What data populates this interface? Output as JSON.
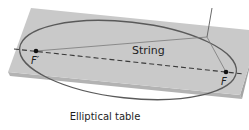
{
  "figure": {
    "caption": "Elliptical table",
    "labels": {
      "string": "String",
      "focus_left": "F′",
      "focus_right": "F"
    },
    "colors": {
      "table_top": "#c9c9c9",
      "table_edge": "#b3b3b3",
      "table_edge_dark": "#9c9c9c",
      "ellipse": "#5a5a5a",
      "string": "#6e6e6e",
      "dashed_axis": "#3a3a3a",
      "focus_dot": "#111111",
      "text": "#1e1e1e"
    },
    "geometry": {
      "focus_left": [
        36,
        51
      ],
      "focus_right": [
        226,
        72
      ],
      "string_point": [
        207,
        37
      ],
      "pencil_top": [
        212,
        8
      ]
    }
  }
}
